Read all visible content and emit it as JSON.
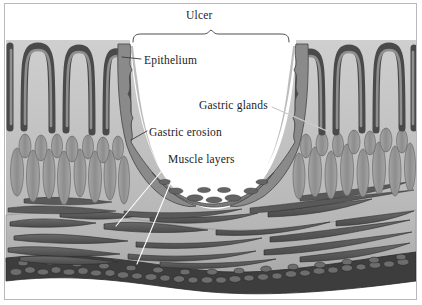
{
  "figure": {
    "title_caption": "",
    "style": "grayscale pen-and-wash anatomical illustration",
    "border_color": "#b9b9b9",
    "background": "#ffffff"
  },
  "labels": {
    "ulcer": "Ulcer",
    "epithelium": "Epithelium",
    "gastric_glands": "Gastric glands",
    "gastric_erosion": "Gastric erosion",
    "muscle_layers": "Muscle layers"
  },
  "annotations": {
    "brace": {
      "name": "ulcer-brace",
      "left_x": 133,
      "right_x": 289,
      "apex_x": 211,
      "top_y": 32,
      "bottom_y": 42
    },
    "leaders": [
      {
        "name": "epithelium-leader",
        "from": [
          141,
          59
        ],
        "to": [
          122,
          57
        ]
      },
      {
        "name": "gastric-glands-leader",
        "from": [
          272,
          107
        ],
        "to": [
          327,
          131
        ]
      },
      {
        "name": "gastric-erosion-leader",
        "from": [
          147,
          131
        ],
        "to": [
          131,
          139
        ]
      },
      {
        "name": "muscle-layers-leader-upper",
        "from": [
          170,
          161
        ],
        "to": [
          116,
          226
        ]
      },
      {
        "name": "muscle-layers-leader-lower",
        "from": [
          180,
          160
        ],
        "to": [
          137,
          264
        ]
      }
    ]
  },
  "palette": {
    "epithelium_dark": "#4a4a4a",
    "epithelium_mid": "#6e6e6e",
    "gland_fill": "#9a9a9a",
    "gland_light": "#b4b4b4",
    "mucosa_bg": "#c3c3c3",
    "submucosa_bg": "#b0b0b0",
    "muscle_fiber": "#5c5c5c",
    "serosa_dark": "#3a3a3a",
    "crater_white": "#ffffff",
    "ink": "#2b2b2b"
  },
  "anatomy_layers": [
    {
      "name": "surface-epithelium",
      "depth_order": 1
    },
    {
      "name": "gastric-pits",
      "depth_order": 2
    },
    {
      "name": "gastric-glands",
      "depth_order": 3
    },
    {
      "name": "muscularis-mucosae",
      "depth_order": 4
    },
    {
      "name": "submucosa",
      "depth_order": 5
    },
    {
      "name": "muscularis-externa",
      "depth_order": 6
    },
    {
      "name": "serosa",
      "depth_order": 7
    }
  ]
}
